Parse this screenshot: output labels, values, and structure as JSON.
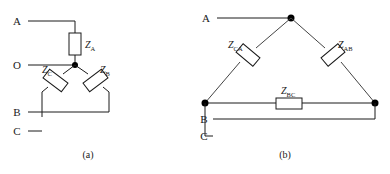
{
  "figure": {
    "background_color": "#ffffff",
    "line_color": "#1a1a1a",
    "width": 390,
    "height": 174
  },
  "diagram_a": {
    "caption": "(a)",
    "type": "wye-star-connection",
    "terminals": [
      {
        "id": "A",
        "label": "A"
      },
      {
        "id": "O",
        "label": "O"
      },
      {
        "id": "B",
        "label": "B"
      },
      {
        "id": "C",
        "label": "C"
      }
    ],
    "impedances": [
      {
        "id": "ZA",
        "symbol": "Z",
        "subscript": "A",
        "orientation": "vertical"
      },
      {
        "id": "ZC",
        "symbol": "Z",
        "subscript": "C",
        "orientation": "diagonal-left"
      },
      {
        "id": "ZB",
        "symbol": "Z",
        "subscript": "B",
        "orientation": "diagonal-right"
      }
    ],
    "neutral_node": "O"
  },
  "diagram_b": {
    "caption": "(b)",
    "type": "delta-connection",
    "terminals": [
      {
        "id": "A",
        "label": "A"
      },
      {
        "id": "B",
        "label": "B"
      },
      {
        "id": "C",
        "label": "C"
      }
    ],
    "impedances": [
      {
        "id": "ZCA",
        "symbol": "Z",
        "subscript": "CA",
        "orientation": "diagonal-left"
      },
      {
        "id": "ZAB",
        "symbol": "Z",
        "subscript": "AB",
        "orientation": "diagonal-right"
      },
      {
        "id": "ZBC",
        "symbol": "Z",
        "subscript": "BC",
        "orientation": "horizontal"
      }
    ]
  }
}
